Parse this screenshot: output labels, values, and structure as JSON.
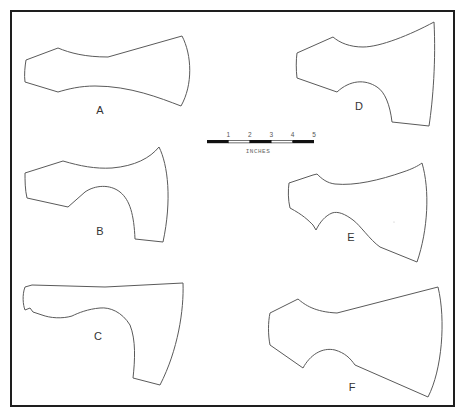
{
  "figure": {
    "frame": {
      "x": 11,
      "y": 11,
      "width": 443,
      "height": 395
    },
    "colors": {
      "frame": "#1e1e1e",
      "outline": "#5a5a5a",
      "background": "#ffffff"
    },
    "shapes": [
      {
        "id": "A",
        "label": "A",
        "label_pos": {
          "x": 100,
          "y": 114
        },
        "path": "M26,60 L58,48 C70,53 85,57 108,57 L182,36 C192,55 193,85 181,106 C160,98 130,86 95,86 C80,86 68,89 58,92 L25,82 C24,75 25,66 26,60 Z"
      },
      {
        "id": "B",
        "label": "B",
        "label_pos": {
          "x": 100,
          "y": 235
        },
        "path": "M25,173 L63,161 C80,166 95,169 112,168 C135,166 150,158 159,147 C168,165 172,200 163,242 L135,239 C134,215 130,200 120,192 C110,184 95,185 85,192 L68,207 L27,198 C25,190 25,180 25,173 Z"
      },
      {
        "id": "C",
        "label": "C",
        "label_pos": {
          "x": 98,
          "y": 340
        },
        "path": "M25,287 L32,285 L105,287 L183,283 C184,310 178,350 160,385 L133,378 C135,360 136,340 130,325 C122,312 110,307 100,308 C88,309 78,313 72,316 C62,319 50,318 42,315 L33,312 L30,308 L25,310 C23,305 22,295 25,287 Z"
      },
      {
        "id": "D",
        "label": "D",
        "label_pos": {
          "x": 359,
          "y": 110
        },
        "path": "M297,53 L333,37 C340,43 350,47 363,47 C380,47 410,35 434,22 C436,60 433,100 429,126 L392,122 C390,105 385,92 377,87 C365,79 350,80 337,92 L297,78 C296,70 296,60 297,53 Z"
      },
      {
        "id": "E",
        "label": "E",
        "label_pos": {
          "x": 351,
          "y": 241
        },
        "path": "M289,183 L313,175 L317,174 C322,179 327,183 335,184 C355,186 380,180 403,172 C412,169 418,166 422,163 C430,190 428,230 417,262 L380,247 C370,240 360,225 353,220 C345,214 338,211 332,213 C325,216 320,222 316,230 L313,225 C308,220 303,215 290,208 C288,200 288,190 289,183 Z"
      },
      {
        "id": "F",
        "label": "F",
        "label_pos": {
          "x": 352,
          "y": 391
        },
        "path": "M270,313 L298,299 C305,305 315,312 337,313 L438,287 C446,320 442,370 428,397 L355,365 C350,358 345,353 335,350 C322,347 310,355 303,368 L270,345 C268,335 268,322 270,313 Z"
      }
    ],
    "scale_bar": {
      "unit": "INCHES",
      "ticks": [
        "1",
        "2",
        "3",
        "4",
        "5"
      ],
      "segments": [
        "black",
        "white",
        "black",
        "white",
        "black"
      ],
      "x_start": 207,
      "x_end": 314,
      "y": 140
    }
  }
}
